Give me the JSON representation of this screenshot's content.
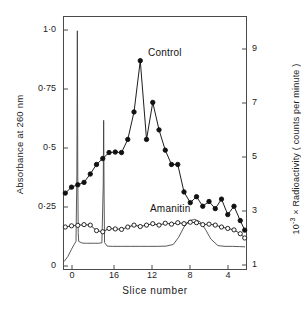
{
  "figure": {
    "title": "",
    "x_axis": {
      "label": "Slice number",
      "ticks": [
        {
          "value": 20,
          "label": "0",
          "px": 72
        },
        {
          "value": 16,
          "label": "16",
          "px": 114
        },
        {
          "value": 12,
          "label": "12",
          "px": 152
        },
        {
          "value": 8,
          "label": "8",
          "px": 190
        },
        {
          "value": 4,
          "label": "4",
          "px": 228
        }
      ],
      "direction": "descending",
      "range": [
        21.5,
        1.0
      ]
    },
    "y_axis_left": {
      "label": "Absorbance at 260 nm",
      "ticks": [
        {
          "value": 1.0,
          "label": "1·0",
          "px": 30
        },
        {
          "value": 0.75,
          "label": "0·75",
          "px": 89
        },
        {
          "value": 0.5,
          "label": "0·5",
          "px": 148
        },
        {
          "value": 0.25,
          "label": "0·25",
          "px": 207
        },
        {
          "value": 0,
          "label": "0",
          "px": 266
        }
      ],
      "range": [
        0,
        1.06
      ]
    },
    "y_axis_right": {
      "label": "10⁻³ × Radioactivity ( counts per minute )",
      "label_prefix": "10",
      "label_exponent": "-3",
      "label_suffix": " × Radioactivity ( counts per minute )",
      "ticks": [
        {
          "value": 9,
          "label": "9",
          "px": 49
        },
        {
          "value": 7,
          "label": "7",
          "px": 103
        },
        {
          "value": 5,
          "label": "5",
          "px": 157
        },
        {
          "value": 3,
          "label": "3",
          "px": 211
        },
        {
          "value": 1,
          "label": "1",
          "px": 265
        }
      ],
      "range": [
        0.55,
        9.8
      ]
    },
    "series_labels": {
      "control": "Control",
      "amanitin": "Amanitin"
    },
    "colors": {
      "axis": "#4a4a4a",
      "trace": "#3b3b3b",
      "control_marker_fill": "#111111",
      "amanitin_marker_fill": "#ffffff",
      "marker_stroke": "#111111"
    }
  },
  "chart_data": {
    "type": "line",
    "title": "",
    "xlabel": "Slice number",
    "ylabel": "Absorbance at 260 nm",
    "ylabel_right": "10^-3 x Radioactivity ( counts per minute )",
    "xlim": [
      21.5,
      1.0
    ],
    "ylim": [
      0,
      1.06
    ],
    "ylim_right": [
      0.55,
      9.8
    ],
    "grid": false,
    "legend": "inline-annotations",
    "x_tick_labels": [
      "0",
      "16",
      "12",
      "8",
      "4"
    ],
    "x_tick_values": [
      20,
      16,
      12,
      8,
      4
    ],
    "y_tick_labels": [
      "0",
      "0·25",
      "0·5",
      "0·75",
      "1·0"
    ],
    "y_tick_values": [
      0,
      0.25,
      0.5,
      0.75,
      1.0
    ],
    "y_right_tick_labels": [
      "1",
      "3",
      "5",
      "7",
      "9"
    ],
    "y_right_tick_values": [
      1,
      3,
      5,
      7,
      9
    ],
    "series": [
      {
        "name": "Control",
        "marker": "filled-circle",
        "axis": "right",
        "units": "10^-3 counts per minute",
        "x": [
          21.3,
          20.6,
          19.9,
          19.2,
          18.5,
          17.8,
          17.1,
          16.4,
          15.7,
          15.0,
          14.3,
          13.6,
          12.9,
          12.2,
          11.5,
          10.8,
          10.1,
          9.4,
          8.7,
          8.0,
          7.3,
          6.6,
          5.9,
          5.2,
          4.5,
          3.8,
          3.1,
          2.4,
          1.7,
          1.2
        ],
        "y_absorbance_scale": [
          0.32,
          0.345,
          0.355,
          0.365,
          0.4,
          0.44,
          0.465,
          0.49,
          0.492,
          0.49,
          0.545,
          0.66,
          0.875,
          0.545,
          0.7,
          0.585,
          0.5,
          0.44,
          0.44,
          0.325,
          0.28,
          0.305,
          0.265,
          0.285,
          0.255,
          0.295,
          0.23,
          0.265,
          0.205,
          0.165
        ],
        "values": [
          3.2,
          3.42,
          3.51,
          3.6,
          3.91,
          4.26,
          4.48,
          4.7,
          4.72,
          4.7,
          5.19,
          6.21,
          8.09,
          5.19,
          6.57,
          5.57,
          4.8,
          4.26,
          4.26,
          3.25,
          2.85,
          3.07,
          2.72,
          2.89,
          2.63,
          2.98,
          2.41,
          2.72,
          2.2,
          1.85
        ]
      },
      {
        "name": "Amanitin",
        "marker": "open-circle",
        "axis": "right",
        "units": "10^-3 counts per minute",
        "x": [
          21.3,
          20.6,
          19.9,
          19.2,
          18.5,
          17.8,
          17.1,
          16.4,
          15.7,
          15.0,
          14.3,
          13.6,
          12.9,
          12.2,
          11.5,
          10.8,
          10.1,
          9.4,
          8.7,
          8.0,
          7.3,
          6.6,
          5.9,
          5.2,
          4.5,
          3.8,
          3.1,
          2.4,
          1.7,
          1.2
        ],
        "y_absorbance_scale": [
          0.178,
          0.183,
          0.185,
          0.188,
          0.186,
          0.163,
          0.158,
          0.172,
          0.17,
          0.168,
          0.178,
          0.186,
          0.18,
          0.186,
          0.192,
          0.186,
          0.194,
          0.19,
          0.196,
          0.192,
          0.198,
          0.196,
          0.188,
          0.19,
          0.186,
          0.178,
          0.172,
          0.166,
          0.15,
          0.132
        ],
        "values": [
          1.62,
          1.66,
          1.68,
          1.7,
          1.69,
          1.49,
          1.45,
          1.57,
          1.55,
          1.53,
          1.62,
          1.69,
          1.64,
          1.69,
          1.74,
          1.69,
          1.76,
          1.72,
          1.78,
          1.74,
          1.8,
          1.78,
          1.71,
          1.72,
          1.69,
          1.62,
          1.57,
          1.51,
          1.37,
          1.21
        ]
      },
      {
        "name": "Absorbance trace",
        "marker": "none",
        "axis": "left",
        "units": "A260",
        "description": "continuous thin scan line with two sharp spikes and a broad hump",
        "x": [
          21.4,
          21.0,
          20.6,
          20.3,
          20.1,
          20.0,
          19.95,
          19.9,
          19.85,
          19.8,
          19.5,
          19.2,
          19.0,
          18.8,
          18.4,
          18.0,
          17.6,
          17.2,
          17.05,
          17.0,
          16.95,
          16.9,
          16.6,
          16.0,
          15.0,
          14.0,
          13.0,
          12.0,
          11.0,
          10.0,
          9.2,
          8.6,
          8.0,
          7.4,
          6.8,
          6.2,
          5.6,
          5.0,
          4.2,
          3.4,
          2.6,
          1.8,
          1.2
        ],
        "values": [
          0.035,
          0.055,
          0.085,
          0.105,
          0.118,
          0.4,
          1.0,
          0.4,
          0.155,
          0.118,
          0.112,
          0.11,
          0.11,
          0.11,
          0.11,
          0.11,
          0.11,
          0.112,
          0.35,
          0.625,
          0.3,
          0.113,
          0.098,
          0.097,
          0.097,
          0.097,
          0.097,
          0.097,
          0.097,
          0.098,
          0.105,
          0.135,
          0.178,
          0.205,
          0.21,
          0.2,
          0.168,
          0.128,
          0.1,
          0.097,
          0.097,
          0.096,
          0.095
        ]
      }
    ],
    "annotations": [
      {
        "text": "Control",
        "x": 13.2,
        "y": 0.795
      },
      {
        "text": "Amanitin",
        "x": 9.1,
        "y": 0.245
      }
    ]
  }
}
